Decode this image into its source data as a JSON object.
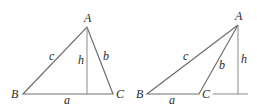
{
  "figure": {
    "triangles": [
      {
        "id": "acute",
        "vertices": {
          "A": "A",
          "B": "B",
          "C": "C"
        },
        "sides": {
          "a": "a",
          "b": "b",
          "c": "c"
        },
        "altitude": "h"
      },
      {
        "id": "obtuse",
        "vertices": {
          "A": "A",
          "B": "B",
          "C": "C"
        },
        "sides": {
          "a": "a",
          "b": "b",
          "c": "c"
        },
        "altitude": "h"
      }
    ]
  },
  "colors": {
    "line": "#6f6f6f",
    "text": "#2a2a2a"
  }
}
